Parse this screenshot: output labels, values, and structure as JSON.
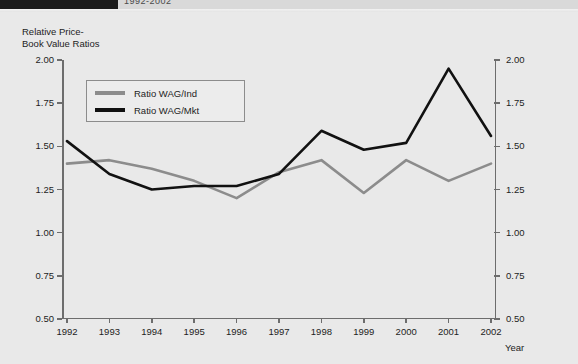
{
  "header": {
    "title": "1992-2002",
    "block_color": "#1b1b1b"
  },
  "chart_data": {
    "type": "line",
    "title": "",
    "ylabel_line1": "Relative Price-",
    "ylabel_line2": "Book Value Ratios",
    "xlabel": "Year",
    "categories": [
      "1992",
      "1993",
      "1994",
      "1995",
      "1996",
      "1997",
      "1998",
      "1999",
      "2000",
      "2001",
      "2002"
    ],
    "x": [
      1992,
      1993,
      1994,
      1995,
      1996,
      1997,
      1998,
      1999,
      2000,
      2001,
      2002
    ],
    "ylim": [
      0.5,
      2.0
    ],
    "yticks": [
      "0.50",
      "0.75",
      "1.00",
      "1.25",
      "1.50",
      "1.75",
      "2.00"
    ],
    "ytick_values": [
      0.5,
      0.75,
      1.0,
      1.25,
      1.5,
      1.75,
      2.0
    ],
    "right_axis_ticks": [
      "0.50",
      "0.75",
      "1.00",
      "1.25",
      "1.50",
      "1.75",
      "2.00"
    ],
    "grid": false,
    "legend_position": "upper-left-inside",
    "series": [
      {
        "name": "Ratio WAG/Ind",
        "color": "#8c8c8c",
        "values": [
          1.4,
          1.42,
          1.37,
          1.3,
          1.2,
          1.35,
          1.42,
          1.23,
          1.42,
          1.3,
          1.4
        ]
      },
      {
        "name": "Ratio WAG/Mkt",
        "color": "#111111",
        "values": [
          1.53,
          1.34,
          1.25,
          1.27,
          1.27,
          1.34,
          1.59,
          1.48,
          1.52,
          1.95,
          1.56
        ]
      }
    ]
  }
}
